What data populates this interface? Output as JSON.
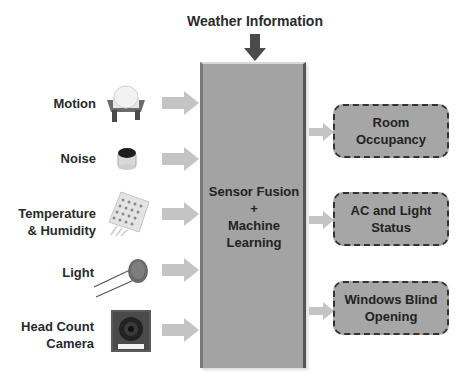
{
  "title": "Weather Information",
  "main_block": {
    "line1": "Sensor Fusion",
    "line2": "+",
    "line3": "Machine",
    "line4": "Learning"
  },
  "sensors": [
    {
      "line1": "Motion",
      "line2": "",
      "icon": "pir-motion-sensor-icon"
    },
    {
      "line1": "Noise",
      "line2": "",
      "icon": "microphone-icon"
    },
    {
      "line1": "Temperature",
      "line2": "& Humidity",
      "icon": "dht-sensor-icon"
    },
    {
      "line1": "Light",
      "line2": "",
      "icon": "photoresistor-icon"
    },
    {
      "line1": "Head Count",
      "line2": "Camera",
      "icon": "camera-module-icon"
    }
  ],
  "outputs": [
    {
      "line1": "Room",
      "line2": "Occupancy"
    },
    {
      "line1": "AC and Light",
      "line2": "Status"
    },
    {
      "line1": "Windows Blind",
      "line2": "Opening"
    }
  ],
  "colors": {
    "main_block": "#a3a3a3",
    "output_block": "#a6a6a6",
    "arrow": "#c4c4c4",
    "down_arrow": "#4a4a4a",
    "text": "#2a2a2a"
  }
}
